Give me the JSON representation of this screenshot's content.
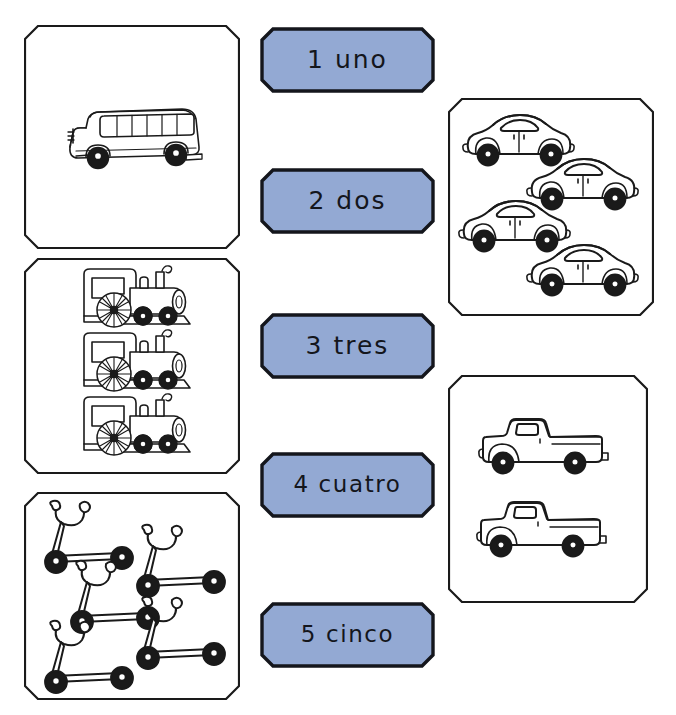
{
  "worksheet": {
    "language": "es",
    "theme": "transportation-counting",
    "background_color": "#ffffff",
    "label_fill_color": "#93a9d3",
    "label_border_color": "#14161c",
    "panel_border_color": "#1a1a1a",
    "art_line_color": "#1a1a1a"
  },
  "labels": [
    {
      "id": "label-1",
      "number": "1",
      "word": "uno",
      "text": "1 uno"
    },
    {
      "id": "label-2",
      "number": "2",
      "word": "dos",
      "text": "2 dos"
    },
    {
      "id": "label-3",
      "number": "3",
      "word": "tres",
      "text": "3 tres"
    },
    {
      "id": "label-4",
      "number": "4",
      "word": "cuatro",
      "text": "4 cuatro"
    },
    {
      "id": "label-5",
      "number": "5",
      "word": "cinco",
      "text": "5 cinco"
    }
  ],
  "panels": [
    {
      "id": "panel-bus",
      "item": "bus",
      "item_label": "school bus",
      "count": 1,
      "matches_label": "1 uno",
      "position": "top-left"
    },
    {
      "id": "panel-cars",
      "item": "car",
      "item_label": "car",
      "count": 4,
      "matches_label": "4 cuatro",
      "position": "top-right"
    },
    {
      "id": "panel-trains",
      "item": "train",
      "item_label": "train locomotive",
      "count": 3,
      "matches_label": "3 tres",
      "position": "middle-left"
    },
    {
      "id": "panel-trucks",
      "item": "truck",
      "item_label": "pickup truck",
      "count": 2,
      "matches_label": "2 dos",
      "position": "bottom-right"
    },
    {
      "id": "panel-scooters",
      "item": "scooter",
      "item_label": "kick scooter",
      "count": 5,
      "matches_label": "5 cinco",
      "position": "bottom-left"
    }
  ]
}
